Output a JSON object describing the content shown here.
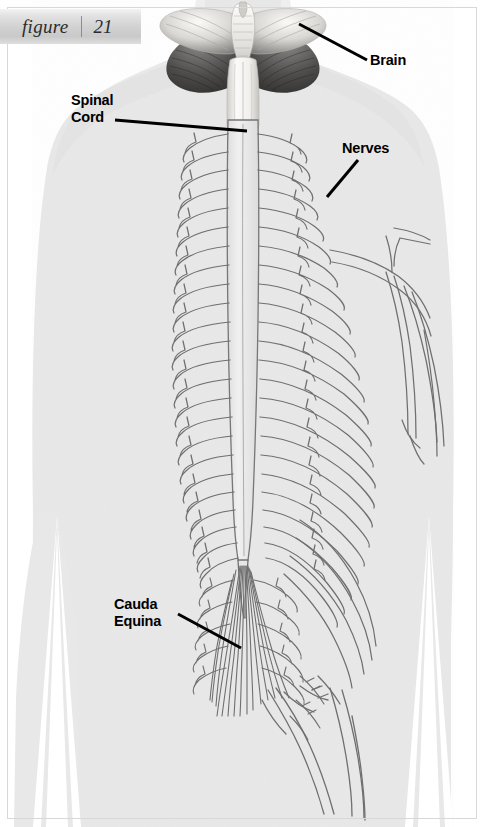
{
  "figure": {
    "word": "figure",
    "number": "21",
    "separator": "|"
  },
  "labels": {
    "brain": "Brain",
    "spinal_cord": "Spinal\nCord",
    "nerves": "Nerves",
    "cauda_equina": "Cauda\nEquina"
  },
  "colors": {
    "background": "#ffffff",
    "body_fill": "#e8e8e8",
    "body_fill_shade": "#e0e0e0",
    "nerve_stroke": "#6f6f6f",
    "cord_fill": "#ebebeb",
    "label_text": "#000000",
    "leader_line": "#000000",
    "frame_border": "#d8d8d8",
    "brain_light": "#f4f2ef",
    "brain_mid": "#9a9a98",
    "brain_dark": "#3c3c3c"
  },
  "illustration": {
    "subject": "human-nervous-system-posterior-view",
    "view": "rear",
    "parts": [
      "brain",
      "cerebellum",
      "brainstem",
      "spinal-cord",
      "spinal-nerve-roots",
      "intercostal-nerves",
      "brachial-plexus",
      "cauda-equina",
      "sciatic-nerve"
    ],
    "spinal_segment_count": 24
  },
  "leaders": {
    "brain": {
      "x1": 367,
      "y1": 60,
      "x2": 299,
      "y2": 24
    },
    "spinal_cord": {
      "x1": 115,
      "y1": 120,
      "x2": 247,
      "y2": 131
    },
    "nerves": {
      "x1": 358,
      "y1": 160,
      "x2": 327,
      "y2": 197
    },
    "cauda_equina": {
      "x1": 178,
      "y1": 614,
      "x2": 241,
      "y2": 648
    }
  }
}
